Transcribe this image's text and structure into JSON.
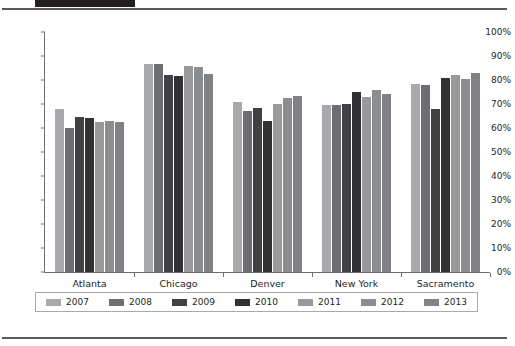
{
  "header": {
    "title": "",
    "title_block_color": "#231f20",
    "rule_color": "#58595b"
  },
  "chart_data": {
    "type": "bar",
    "title": "",
    "xlabel": "",
    "ylabel": "",
    "ylim": [
      0,
      100
    ],
    "ytick_labels": [
      "100%",
      "90%",
      "80%",
      "70%",
      "60%",
      "50%",
      "40%",
      "30%",
      "20%",
      "10%",
      "0%"
    ],
    "ytick_values": [
      100,
      90,
      80,
      70,
      60,
      50,
      40,
      30,
      20,
      10,
      0
    ],
    "grid": false,
    "legend_position": "bottom",
    "categories": [
      "Atlanta",
      "Chicago",
      "Denver",
      "New York",
      "Sacramento"
    ],
    "series": [
      {
        "name": "2007",
        "color": "#a7a9ac",
        "values": [
          68,
          86.5,
          71,
          69.5,
          78.5
        ]
      },
      {
        "name": "2008",
        "color": "#6d6e71",
        "values": [
          60,
          86.5,
          67,
          69.5,
          78
        ]
      },
      {
        "name": "2009",
        "color": "#414042",
        "values": [
          64.5,
          82,
          68.5,
          70,
          68
        ]
      },
      {
        "name": "2010",
        "color": "#313133",
        "values": [
          64,
          81.5,
          63,
          75,
          81
        ]
      },
      {
        "name": "2011",
        "color": "#98999b",
        "values": [
          62.5,
          86,
          70,
          73,
          82
        ]
      },
      {
        "name": "2012",
        "color": "#8c8d8f",
        "values": [
          63,
          85.5,
          72.5,
          76,
          80.5
        ]
      },
      {
        "name": "2013",
        "color": "#808285",
        "values": [
          62.5,
          82.5,
          73.5,
          74,
          83
        ]
      }
    ]
  }
}
